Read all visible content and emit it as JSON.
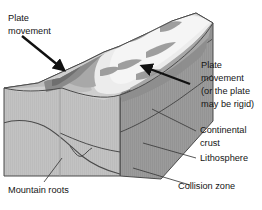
{
  "figure": {
    "background_color": "#ffffff",
    "ink_color": "#151515"
  },
  "labels": {
    "plate_movement_left_line1": "Plate",
    "plate_movement_left_line2": "movement",
    "plate_movement_right_line1": "Plate",
    "plate_movement_right_line2": "movement",
    "plate_movement_right_line3": "(or the plate",
    "plate_movement_right_line4": "may be rigid)",
    "continental_crust_line1": "Continental",
    "continental_crust_line2": "crust",
    "lithosphere": "Lithosphere",
    "collision_zone": "Collision zone",
    "mountain_roots": "Mountain roots"
  },
  "block": {
    "front_face_color": "#c2c2c2",
    "right_face_color": "#9b9b9b",
    "top_terrain_light_color": "#ececec",
    "top_terrain_mid_color": "#cfcfcf",
    "top_terrain_dark_color": "#9e9e9e",
    "top_terrain_shadow_color": "#7f7f7f",
    "outline_color": "#4a4a4a",
    "leader_line_color": "#3a3a3a",
    "arrow_color": "#111111"
  },
  "arrows": {
    "left_arrow_direction": "down-right-into-range",
    "right_arrow_direction": "up-left-into-range"
  }
}
